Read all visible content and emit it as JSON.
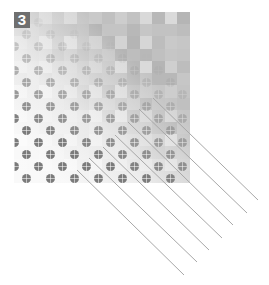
{
  "figure": {
    "badge_label": "3",
    "colors": {
      "badge_bg": "#6f6f6f",
      "badge_text": "#ffffff",
      "dot": "#7b7b7b",
      "line": "#a8a8a8"
    },
    "mosaic": {
      "cols": 14,
      "rows": 14,
      "shades": [
        "#cfcfcf",
        "#c4c4c4",
        "#d9d9d9",
        "#bdbdbd",
        "#c9c9c9",
        "#b8b8b8",
        "#d3d3d3",
        "#c0c0c0",
        "#dadada",
        "#c6c6c6",
        "#cdcdcd",
        "#b5b5b5",
        "#d6d6d6",
        "#c2c2c2"
      ]
    },
    "dots": {
      "spacing_x": 24,
      "row_height": 12,
      "diameter": 9
    },
    "lines": [
      {
        "x1": 153,
        "y1": 98,
        "x2": 258,
        "y2": 200
      },
      {
        "x1": 139,
        "y1": 109,
        "x2": 247,
        "y2": 213
      },
      {
        "x1": 128,
        "y1": 122,
        "x2": 233,
        "y2": 225
      },
      {
        "x1": 115,
        "y1": 135,
        "x2": 222,
        "y2": 238
      },
      {
        "x1": 103,
        "y1": 147,
        "x2": 209,
        "y2": 250
      },
      {
        "x1": 89,
        "y1": 158,
        "x2": 197,
        "y2": 262
      },
      {
        "x1": 77,
        "y1": 170,
        "x2": 184,
        "y2": 275
      }
    ]
  }
}
